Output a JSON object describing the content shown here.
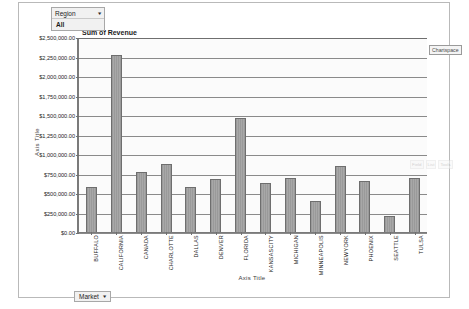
{
  "window": {
    "background_color": "#ffffff",
    "frame_border_color": "#b9b9b9"
  },
  "filter": {
    "field_label": "Region",
    "dropdown_arrow": "chevron-down-icon",
    "arrow_glyph": "▾",
    "selected_value": "All"
  },
  "field_button": {
    "label": "Market",
    "arrow_glyph": "▾"
  },
  "chartspace": {
    "tag_label": "Chartspace"
  },
  "ghost_toolbar": {
    "items": [
      "Field",
      "List",
      "Tools"
    ]
  },
  "chart_data": {
    "type": "bar",
    "title": "Sum of Revenue",
    "xlabel": "Axis Title",
    "ylabel": "Axis Title",
    "ylim": [
      0,
      2500000
    ],
    "ytick_step": 250000,
    "grid": true,
    "legend_position": "none",
    "bar_color": "#a8a8a8",
    "bar_border_color": "#6e6e6e",
    "plot_background": "#fbfbfb",
    "ytick_labels": [
      "$2,500,000.00",
      "$2,250,000.00",
      "$2,000,000.00",
      "$1,750,000.00",
      "$1,500,000.00",
      "$1,250,000.00",
      "$1,000,000.00",
      "$750,000.00",
      "$500,000.00",
      "$250,000.00",
      "$0.00"
    ],
    "ytick_values": [
      2500000,
      2250000,
      2000000,
      1750000,
      1500000,
      1250000,
      1000000,
      750000,
      500000,
      250000,
      0
    ],
    "categories": [
      "BUFFALO",
      "CALIFORNIA",
      "CANADA",
      "CHARLOTTE",
      "DALLAS",
      "DENVER",
      "FLORIDA",
      "KANSASCITY",
      "MICHIGAN",
      "MINNEAPOLIS",
      "NEWYORK",
      "PHOENIX",
      "SEATTLE",
      "TULSA"
    ],
    "values": [
      575000,
      2270000,
      775000,
      875000,
      575000,
      680000,
      1460000,
      630000,
      690000,
      400000,
      840000,
      660000,
      200000,
      690000
    ]
  }
}
